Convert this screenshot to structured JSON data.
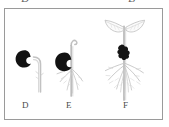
{
  "figure": {
    "background_color": "#ffffff",
    "frame_color": "#9a9a9a",
    "seed_color": "#1a1a1a",
    "plant_outline_color": "#b5b5b5",
    "label_color": "#4a4a4a"
  },
  "clipped_glyphs": {
    "left": "D",
    "right": "B"
  },
  "stages": [
    {
      "id": "D",
      "label": "D",
      "caption": "Germinating seed with emerging hooked radicle",
      "has_seed": true,
      "has_shoot": true,
      "has_roots": false,
      "has_leaves": false
    },
    {
      "id": "E",
      "label": "E",
      "caption": "Seedling with elongating hooked hypocotyl and developing roots",
      "has_seed": true,
      "has_shoot": true,
      "has_roots": true,
      "has_leaves": false
    },
    {
      "id": "F",
      "label": "F",
      "caption": "Young seedling with expanded cotyledons and branched root system",
      "has_seed": true,
      "has_shoot": true,
      "has_roots": true,
      "has_leaves": true,
      "leaf_count": 2
    }
  ]
}
